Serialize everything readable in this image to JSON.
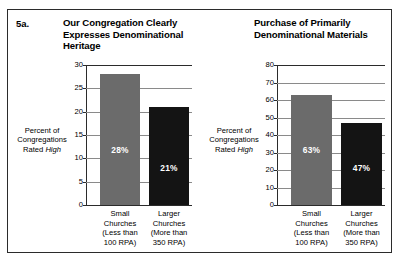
{
  "figure": {
    "number": "5a.",
    "frame_color": "#2b2b2b",
    "background": "#ffffff"
  },
  "colors": {
    "bar_small": "#6b6b6b",
    "bar_large": "#141414",
    "gridline": "#8a8a8a",
    "axis": "#2b2b2b",
    "value_label": "#ffffff"
  },
  "chart_data": [
    {
      "type": "bar",
      "title": "Our Congregation Clearly Expresses Denominational Heritage",
      "xlabel": "",
      "ylabel": "Percent of Congregations Rated High",
      "ylabel_lines": [
        "Percent of",
        "Congregations",
        "Rated ",
        "High"
      ],
      "ylim": [
        0,
        30
      ],
      "yticks": [
        0,
        5,
        10,
        15,
        20,
        25,
        30
      ],
      "ytick_labels": [
        "0",
        "5",
        "10",
        "15",
        "20",
        "25",
        "30"
      ],
      "grid": true,
      "legend": "none",
      "categories": [
        "Small Churches (Less than 100 RPA)",
        "Larger Churches (More than 350 RPA)"
      ],
      "category_lines": [
        [
          "Small",
          "Churches",
          "(Less than",
          "100 RPA)"
        ],
        [
          "Larger",
          "Churches",
          "(More than",
          "350 RPA)"
        ]
      ],
      "values": [
        28,
        21
      ],
      "value_labels": [
        "28%",
        "21%"
      ],
      "bar_colors": [
        "#6b6b6b",
        "#141414"
      ]
    },
    {
      "type": "bar",
      "title": "Purchase of Primarily Denominational Materials",
      "xlabel": "",
      "ylabel": "Percent of Congregations Rated High",
      "ylabel_lines": [
        "Percent of",
        "Congregations",
        "Rated ",
        "High"
      ],
      "ylim": [
        0,
        80
      ],
      "yticks": [
        0,
        10,
        20,
        30,
        40,
        50,
        60,
        70,
        80
      ],
      "ytick_labels": [
        "0",
        "10",
        "20",
        "30",
        "40",
        "50",
        "60",
        "70",
        "80"
      ],
      "grid": true,
      "legend": "none",
      "categories": [
        "Small Churches (Less than 100 RPA)",
        "Larger Churches (More than 350 RPA)"
      ],
      "category_lines": [
        [
          "Small",
          "Churches",
          "(Less than",
          "100 RPA)"
        ],
        [
          "Larger",
          "Churches",
          "(More than",
          "350 RPA)"
        ]
      ],
      "values": [
        63,
        47
      ],
      "value_labels": [
        "63%",
        "47%"
      ],
      "bar_colors": [
        "#6b6b6b",
        "#141414"
      ]
    }
  ]
}
